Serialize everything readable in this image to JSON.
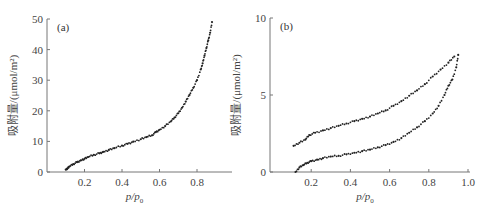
{
  "chart_data": [
    {
      "type": "scatter",
      "panel_label": "(a)",
      "title": "",
      "xlabel": "p/p0",
      "ylabel": "吸附量/(μmol/m²)",
      "xlim": [
        0,
        0.97
      ],
      "ylim": [
        0,
        50
      ],
      "xticks": [
        0.2,
        0.4,
        0.6,
        0.8
      ],
      "xtick_labels": [
        "0.2",
        "0.4",
        "0.6",
        "0.8"
      ],
      "yticks": [
        0,
        10,
        20,
        30,
        40,
        50
      ],
      "ytick_labels": [
        "0",
        "10",
        "20",
        "30",
        "40",
        "50"
      ],
      "grid": false,
      "legend": null,
      "series": [
        {
          "name": "isotherm",
          "x": [
            0.1,
            0.11,
            0.12,
            0.14,
            0.16,
            0.18,
            0.2,
            0.22,
            0.25,
            0.28,
            0.3,
            0.33,
            0.36,
            0.4,
            0.43,
            0.46,
            0.5,
            0.53,
            0.56,
            0.58,
            0.6,
            0.63,
            0.66,
            0.68,
            0.7,
            0.72,
            0.74,
            0.76,
            0.78,
            0.8,
            0.82,
            0.83,
            0.84,
            0.85,
            0.86,
            0.87,
            0.88
          ],
          "y": [
            0.8,
            1.2,
            1.8,
            2.6,
            3.2,
            3.8,
            4.3,
            4.9,
            5.6,
            6.1,
            6.6,
            7.2,
            7.8,
            8.6,
            9.2,
            9.9,
            10.7,
            11.4,
            12.0,
            13.0,
            13.8,
            15.0,
            16.5,
            17.8,
            19.2,
            21.0,
            23.0,
            25.2,
            27.5,
            30.0,
            33.5,
            35.5,
            38.0,
            40.5,
            43.0,
            45.5,
            49.0
          ]
        }
      ]
    },
    {
      "type": "scatter",
      "panel_label": "(b)",
      "title": "",
      "xlabel": "p/p0",
      "ylabel": "吸附量/(μmol/m²)",
      "xlim": [
        0,
        1.0
      ],
      "ylim": [
        0,
        10
      ],
      "xticks": [
        0.2,
        0.4,
        0.6,
        0.8,
        1.0
      ],
      "xtick_labels": [
        "0.2",
        "0.4",
        "0.6",
        "0.8",
        "1.0"
      ],
      "yticks": [
        0,
        5,
        10
      ],
      "ytick_labels": [
        "0",
        "5",
        "10"
      ],
      "grid": false,
      "legend": null,
      "series": [
        {
          "name": "adsorption branch (lower)",
          "x": [
            0.12,
            0.14,
            0.16,
            0.18,
            0.2,
            0.23,
            0.26,
            0.3,
            0.34,
            0.38,
            0.42,
            0.46,
            0.5,
            0.54,
            0.58,
            0.62,
            0.66,
            0.7,
            0.74,
            0.78,
            0.82,
            0.85,
            0.88,
            0.9,
            0.92,
            0.94,
            0.95
          ],
          "y": [
            0.0,
            0.3,
            0.45,
            0.6,
            0.7,
            0.8,
            0.9,
            1.0,
            1.05,
            1.15,
            1.25,
            1.35,
            1.45,
            1.6,
            1.75,
            1.95,
            2.2,
            2.55,
            2.9,
            3.3,
            3.8,
            4.3,
            5.0,
            5.6,
            6.0,
            6.8,
            7.6
          ]
        },
        {
          "name": "desorption branch (upper)",
          "x": [
            0.11,
            0.14,
            0.17,
            0.19,
            0.22,
            0.26,
            0.3,
            0.34,
            0.38,
            0.42,
            0.46,
            0.5,
            0.54,
            0.58,
            0.62,
            0.66,
            0.7,
            0.74,
            0.78,
            0.82,
            0.86,
            0.9,
            0.93
          ],
          "y": [
            1.7,
            1.9,
            2.1,
            2.4,
            2.55,
            2.7,
            2.85,
            3.0,
            3.15,
            3.3,
            3.45,
            3.6,
            3.8,
            4.0,
            4.3,
            4.6,
            4.95,
            5.3,
            5.7,
            6.2,
            6.65,
            7.1,
            7.5
          ]
        }
      ]
    }
  ]
}
